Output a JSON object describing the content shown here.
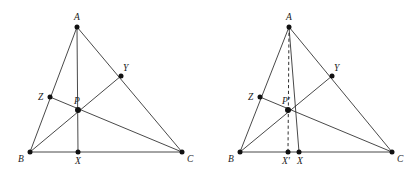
{
  "canvas": {
    "width": 419,
    "height": 175,
    "background": "#ffffff",
    "stroke_color": "#1a1a1a",
    "point_color": "#111111"
  },
  "figures": [
    {
      "id": "left-figure",
      "name": "triangle-abc-with-concurrent-cevians",
      "points": [
        {
          "key": "A",
          "label": "A",
          "x": 77,
          "y": 27,
          "label_dx": -3,
          "label_dy": -14,
          "radius": 2.5
        },
        {
          "key": "B",
          "label": "B",
          "x": 30,
          "y": 152,
          "label_dx": -12,
          "label_dy": 3,
          "radius": 2.5
        },
        {
          "key": "C",
          "label": "C",
          "x": 182,
          "y": 152,
          "label_dx": 5,
          "label_dy": 3,
          "radius": 2.5
        },
        {
          "key": "X",
          "label": "X",
          "x": 78,
          "y": 152,
          "label_dx": -3,
          "label_dy": 5,
          "radius": 2.5
        },
        {
          "key": "Y",
          "label": "Y",
          "x": 121,
          "y": 76,
          "label_dx": 2,
          "label_dy": -12,
          "radius": 2.5
        },
        {
          "key": "Z",
          "label": "Z",
          "x": 50,
          "y": 97,
          "label_dx": -12,
          "label_dy": -4,
          "radius": 2.5
        },
        {
          "key": "P",
          "label": "P",
          "x": 78,
          "y": 110,
          "label_dx": -4,
          "label_dy": -13,
          "radius": 3.0
        }
      ],
      "segments": [
        {
          "name": "side-AB",
          "from": "A",
          "to": "B",
          "style": "solid"
        },
        {
          "name": "side-AC",
          "from": "A",
          "to": "C",
          "style": "solid"
        },
        {
          "name": "side-BC",
          "from": "B",
          "to": "C",
          "style": "solid"
        },
        {
          "name": "cevian-AX",
          "from": "A",
          "to": "X",
          "style": "solid"
        },
        {
          "name": "cevian-BY",
          "from": "B",
          "to": "Y",
          "style": "solid"
        },
        {
          "name": "cevian-CZ",
          "from": "C",
          "to": "Z",
          "style": "solid"
        }
      ]
    },
    {
      "id": "right-figure",
      "name": "triangle-abc-with-perturbed-cevian",
      "points": [
        {
          "key": "A",
          "label": "A",
          "x": 289,
          "y": 27,
          "label_dx": -3,
          "label_dy": -14,
          "radius": 2.5
        },
        {
          "key": "B",
          "label": "B",
          "x": 240,
          "y": 152,
          "label_dx": -12,
          "label_dy": 3,
          "radius": 2.5
        },
        {
          "key": "C",
          "label": "C",
          "x": 392,
          "y": 152,
          "label_dx": 5,
          "label_dy": 3,
          "radius": 2.5
        },
        {
          "key": "X",
          "label": "X",
          "x": 299,
          "y": 152,
          "label_dx": -2,
          "label_dy": 5,
          "radius": 2.5
        },
        {
          "key": "Xp",
          "label": "X'",
          "x": 288,
          "y": 152,
          "label_dx": -6,
          "label_dy": 5,
          "radius": 2.5
        },
        {
          "key": "Y",
          "label": "Y",
          "x": 332,
          "y": 76,
          "label_dx": 2,
          "label_dy": -12,
          "radius": 2.5
        },
        {
          "key": "Z",
          "label": "Z",
          "x": 260,
          "y": 97,
          "label_dx": -12,
          "label_dy": -4,
          "radius": 2.5
        },
        {
          "key": "P",
          "label": "P'",
          "x": 288,
          "y": 110,
          "label_dx": -6,
          "label_dy": -13,
          "radius": 3.0
        }
      ],
      "segments": [
        {
          "name": "side-AB",
          "from": "A",
          "to": "B",
          "style": "solid"
        },
        {
          "name": "side-AC",
          "from": "A",
          "to": "C",
          "style": "solid"
        },
        {
          "name": "side-BC",
          "from": "B",
          "to": "C",
          "style": "solid"
        },
        {
          "name": "cevian-AX",
          "from": "A",
          "to": "X",
          "style": "solid"
        },
        {
          "name": "cevian-BY",
          "from": "B",
          "to": "Y",
          "style": "solid"
        },
        {
          "name": "cevian-CZ",
          "from": "C",
          "to": "Z",
          "style": "solid"
        },
        {
          "name": "dashed-cevian-AXprime",
          "from": "A",
          "to": "Xp",
          "style": "dashed"
        }
      ]
    }
  ]
}
